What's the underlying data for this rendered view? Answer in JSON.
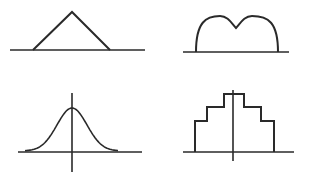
{
  "diagram": {
    "panels": [
      {
        "id": "triangular",
        "label": "Triangular distribution",
        "baseline": {
          "x1": 10,
          "x2": 145,
          "y": 50
        },
        "points": [
          [
            33,
            50
          ],
          [
            72,
            12
          ],
          [
            110,
            50
          ]
        ]
      },
      {
        "id": "bimodal",
        "label": "Bimodal distribution",
        "baseline": {
          "x1": 183,
          "x2": 289,
          "y": 52
        },
        "feet": {
          "left": 196,
          "right": 278
        },
        "peaks": [
          [
            220,
            16
          ],
          [
            252,
            16
          ]
        ],
        "dip": [
          236,
          28
        ]
      },
      {
        "id": "normal",
        "label": "Normal (bell) distribution",
        "baseline": {
          "x1": 18,
          "x2": 142,
          "y": 152
        },
        "vertical_axis": {
          "x": 72,
          "y1": 93,
          "y2": 172
        },
        "peak": [
          72,
          108
        ],
        "tails": {
          "left": 25,
          "right": 118
        }
      },
      {
        "id": "stepped",
        "label": "Stepped symmetric histogram",
        "baseline": {
          "x1": 183,
          "x2": 294,
          "y": 152
        },
        "vertical_axis": {
          "x": 233,
          "y1": 90,
          "y2": 161
        },
        "steps": [
          {
            "x_left": 195,
            "x_right": 274,
            "y": 121
          },
          {
            "x_left": 207,
            "x_right": 261,
            "y": 107
          },
          {
            "x_left": 224,
            "x_right": 244,
            "y": 94
          }
        ]
      }
    ],
    "stroke_color": "#2a2a2a",
    "background_color": "#ffffff"
  }
}
